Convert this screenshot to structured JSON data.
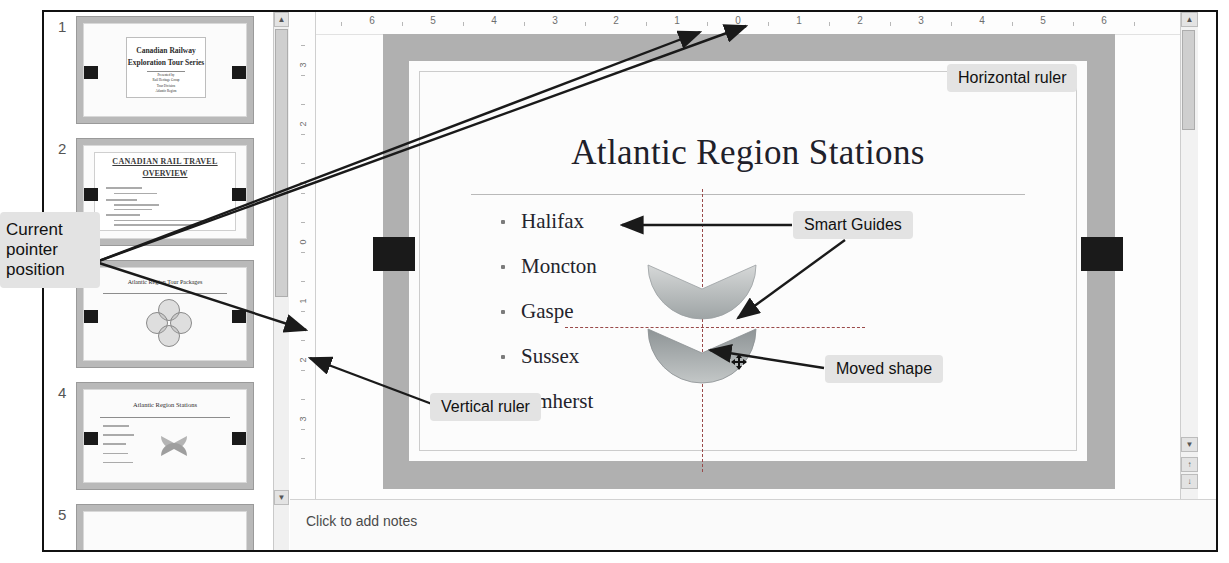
{
  "app": {
    "type": "presentation-editor",
    "notes_placeholder": "Click to add notes"
  },
  "thumbnails": {
    "slides": [
      {
        "number": "1",
        "title_line1": "Canadian Railway",
        "title_line2": "Exploration Tour Series",
        "subtitle": "Presented by",
        "sub2": "Rail Heritage Group",
        "sub3": "Tour Division",
        "sub4": "Atlantic Region"
      },
      {
        "number": "2",
        "title_line1": "CANADIAN RAIL TRAVEL",
        "title_line2": "OVERVIEW",
        "body": "Transportation / Itineraries / Seasonal tips"
      },
      {
        "number": "3",
        "title_line1": "Atlantic Region Tour Packages",
        "title_line2": ""
      },
      {
        "number": "4",
        "title_line1": "Atlantic Region Stations",
        "bullets": [
          "Halifax",
          "Moncton",
          "Gaspe",
          "Sussex",
          "Amherst"
        ]
      },
      {
        "number": "5",
        "title_line1": "Atlantic Region Fares",
        "title_line2": ""
      }
    ]
  },
  "rulers": {
    "horizontal_ticks": [
      "6",
      "5",
      "4",
      "3",
      "2",
      "1",
      "0",
      "1",
      "2",
      "3",
      "4",
      "5",
      "6"
    ],
    "vertical_ticks": [
      "3",
      "2",
      "1",
      "0",
      "1",
      "2",
      "3"
    ]
  },
  "slide": {
    "title": "Atlantic Region Stations",
    "bullets": [
      "Halifax",
      "Moncton",
      "Gaspe",
      "Sussex",
      "Amherst"
    ],
    "guide_color": "#9a4a4a",
    "shape_color": "#9aa0a2"
  },
  "annotations": {
    "current_pointer": "Current pointer position",
    "horizontal_ruler": "Horizontal ruler",
    "smart_guides": "Smart Guides",
    "moved_shape": "Moved shape",
    "vertical_ruler": "Vertical ruler"
  },
  "scroll": {
    "up_arrow": "▲",
    "down_arrow": "▼"
  }
}
